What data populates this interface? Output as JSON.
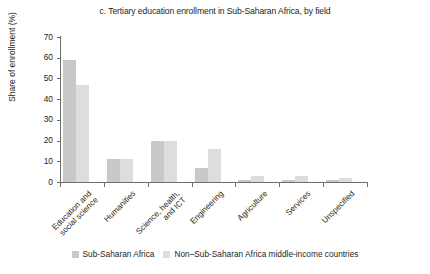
{
  "chart_data": {
    "type": "bar",
    "title": "c. Tertiary education enrollment in Sub-Saharan Africa, by field",
    "xlabel": "",
    "ylabel": "Share of enrollment (%)",
    "ylim": [
      0,
      70
    ],
    "ytick_step": 10,
    "yticks": [
      "70",
      "60",
      "50",
      "40",
      "30",
      "20",
      "10",
      "0"
    ],
    "grid": false,
    "legend_position": "bottom",
    "categories": [
      "Education and\nsocial science",
      "Humanities",
      "Science, health,\nand ICT",
      "Engineering",
      "Agriculture",
      "Services",
      "Unspecified"
    ],
    "category_labels": [
      [
        "Education and",
        "social science"
      ],
      [
        "Humanities"
      ],
      [
        "Science, health,",
        "and ICT"
      ],
      [
        "Engineering"
      ],
      [
        "Agriculture"
      ],
      [
        "Services"
      ],
      [
        "Unspecified"
      ]
    ],
    "series": [
      {
        "name": "Sub-Saharan Africa",
        "color": "#c7c8ca",
        "values": [
          59,
          11,
          20,
          7,
          1,
          1,
          1
        ]
      },
      {
        "name": "Non–Sub-Saharan Africa middle-income countries",
        "color": "#dcdddf",
        "values": [
          47,
          11,
          20,
          16,
          3,
          3,
          2
        ]
      }
    ]
  },
  "legend": {
    "items": [
      {
        "label": "Sub-Saharan Africa",
        "color": "#c7c8ca"
      },
      {
        "label": "Non–Sub-Saharan Africa middle-income countries",
        "color": "#dcdddf"
      }
    ]
  }
}
